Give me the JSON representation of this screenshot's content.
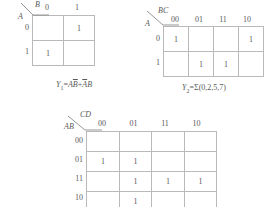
{
  "page": {
    "background": "#ffffff",
    "ink": "#5a5a5a",
    "gridline": "#b9b9b9"
  },
  "kmaps": [
    {
      "id": "kmap-1",
      "corner": {
        "top_label": "B",
        "bottom_label": "A"
      },
      "col_headers": [
        "0",
        "1"
      ],
      "row_headers": [
        "0",
        "1"
      ],
      "cells": [
        [
          "",
          "1"
        ],
        [
          "1",
          ""
        ]
      ],
      "caption": {
        "name": "Y",
        "sub": "1",
        "eq": "=",
        "term1_a": "A",
        "term1_b": "B",
        "plus": "+",
        "term2_a": "A",
        "term2_b": "B",
        "full_text": "Y1=AB̄+ĀB"
      }
    },
    {
      "id": "kmap-2",
      "corner": {
        "top_label": "BC",
        "bottom_label": "A"
      },
      "col_headers": [
        "00",
        "01",
        "11",
        "10"
      ],
      "row_headers": [
        "0",
        "1"
      ],
      "cells": [
        [
          "1",
          "",
          "",
          "1"
        ],
        [
          "",
          "1",
          "1",
          ""
        ]
      ],
      "caption": {
        "name": "Y",
        "sub": "2",
        "eq": "=",
        "sigma": "Σ",
        "minterms": "(0,2,5,7)",
        "full_text": "Y2=Σ(0,2,5,7)"
      }
    },
    {
      "id": "kmap-3",
      "corner": {
        "top_label": "CD",
        "bottom_label": "AB"
      },
      "col_headers": [
        "00",
        "01",
        "11",
        "10"
      ],
      "row_headers": [
        "00",
        "01",
        "11",
        "10"
      ],
      "cells": [
        [
          "",
          "",
          "",
          ""
        ],
        [
          "1",
          "1",
          "",
          ""
        ],
        [
          "",
          "1",
          "1",
          "1"
        ],
        [
          "",
          "1",
          "",
          ""
        ]
      ]
    }
  ]
}
